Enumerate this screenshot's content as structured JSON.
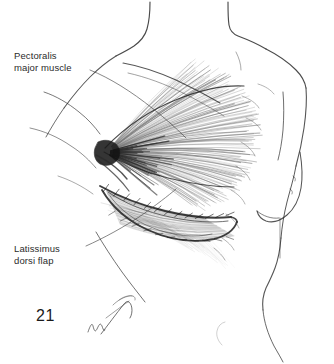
{
  "figure": {
    "number": "21",
    "domain": "medical-illustration",
    "medium": "pen-and-ink line drawing",
    "background_color": "#ffffff",
    "ink_color": "#1a1a1a"
  },
  "labels": [
    {
      "id": "pectoralis",
      "line1": "Pectoralis",
      "line2": "major muscle",
      "text": "Pectoralis\nmajor muscle",
      "x": 14,
      "y": 50
    },
    {
      "id": "latissimus",
      "line1": "Latissimus",
      "line2": "dorsi flap",
      "text": "Latissimus\ndorsi flap",
      "x": 14,
      "y": 243
    }
  ],
  "signature": {
    "present": true,
    "legible": false,
    "description": "artist cursive signature"
  },
  "anatomy": {
    "parts": [
      "neck",
      "clavicle",
      "shoulder",
      "upper-arm",
      "axilla",
      "pectoralis-major-muscle",
      "latissimus-dorsi-flap",
      "rib-markings",
      "contralateral-breast",
      "torso",
      "waist"
    ]
  }
}
